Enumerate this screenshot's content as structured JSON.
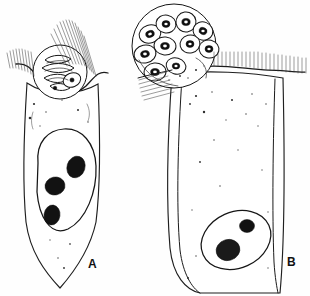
{
  "figure": {
    "background_color": "#fefefe",
    "ink_color": "#1b1b1b",
    "width": 310,
    "height": 296,
    "medium": "pen-and-ink line drawing with stipple shading"
  },
  "panels": [
    {
      "id": "A",
      "label": "A",
      "label_x": 88,
      "label_y": 268,
      "description": "Host epithelial cell with apical parasitophorous vacuole containing elongate merozoites; cell tapers to a pointed base",
      "host_cell": {
        "name": "columnar epithelial cell",
        "shape": "elongate, tapering to a point basally",
        "nucleus": {
          "name": "host-cell nucleus",
          "shape": "large ovoid",
          "center_x": 66,
          "center_y": 188,
          "rx": 31,
          "ry": 45,
          "chromatin_bodies": 3,
          "chromatin_color": "#121212"
        },
        "brush_border": {
          "name": "microvilli brush border",
          "present": true,
          "style": "fine parallel hatching",
          "segments": 2
        }
      },
      "parasite": {
        "name": "schizont in parasitophorous vacuole",
        "center_x": 60,
        "center_y": 72,
        "radius": 27,
        "contents": "curved elongate merozoites in longitudinal section",
        "merozoite_count": 5,
        "section_view": "longitudinal"
      }
    },
    {
      "id": "B",
      "label": "B",
      "label_x": 287,
      "label_y": 266,
      "description": "Host epithelial cell with large apical schizont packed with ring-profile merozoites cut in cross section; columnar cell with basal nucleus",
      "host_cell": {
        "name": "columnar epithelial cell",
        "shape": "broad columnar with rounded base",
        "nucleus": {
          "name": "host-cell nucleus",
          "shape": "ovoid, obliquely set",
          "center_x": 236,
          "center_y": 240,
          "rx": 34,
          "ry": 27,
          "chromatin_bodies": 2,
          "chromatin_color": "#121212"
        },
        "brush_border": {
          "name": "microvilli brush border",
          "present": true,
          "style": "vertical parallel strokes along apical surface",
          "segments": 2
        }
      },
      "parasite": {
        "name": "mature schizont in parasitophorous vacuole",
        "center_x": 174,
        "center_y": 46,
        "radius": 42,
        "contents": "merozoites in cross section appearing as dark rings",
        "merozoite_count": 9,
        "section_view": "transverse"
      }
    }
  ],
  "legend_text": ""
}
